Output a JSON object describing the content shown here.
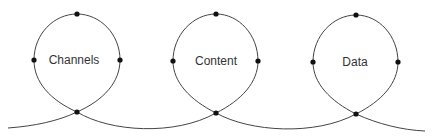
{
  "diagram": {
    "type": "looped-path",
    "colors": {
      "line": "#444444",
      "dot": "#111111",
      "text": "#333333",
      "background": "#ffffff"
    },
    "loops": [
      {
        "label": "Channels"
      },
      {
        "label": "Content"
      },
      {
        "label": "Data"
      }
    ]
  }
}
